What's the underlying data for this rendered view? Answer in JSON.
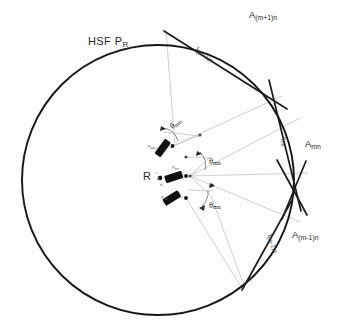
{
  "figure": {
    "title_label": "HSF P",
    "title_sub": "R",
    "center_label": "R"
  },
  "apertures": [
    {
      "name": "aperture-upper",
      "text": "A",
      "sub": "(m+1)n"
    },
    {
      "name": "aperture-middle",
      "text": "A",
      "sub": "mn"
    },
    {
      "name": "aperture-lower",
      "text": "A",
      "sub": "(m-1)n"
    }
  ],
  "arc_labels": [
    {
      "name": "arc-upper",
      "text": "l",
      "sub": "(m+1)n"
    },
    {
      "name": "arc-middle",
      "text": "l",
      "sub": "mn"
    },
    {
      "name": "arc-lower",
      "text": "l",
      "sub": "(m-1)n"
    }
  ],
  "angles": [
    {
      "name": "theta-upper",
      "text": "θ",
      "sub": "mn"
    },
    {
      "name": "theta-middle",
      "text": "θ",
      "sub": "mn"
    },
    {
      "name": "theta-lower",
      "text": "θ",
      "sub": "mn"
    }
  ],
  "elements": [
    {
      "name": "element-upper",
      "tag": "P",
      "sub": "mn"
    },
    {
      "name": "element-middle",
      "tag": "P",
      "sub": "mn"
    },
    {
      "name": "element-lower",
      "tag": "P",
      "sub": "mn"
    }
  ],
  "annotations": {
    "center_note_1": "r",
    "center_note_2": "Δ",
    "center_note_3": "d"
  },
  "colors": {
    "ink": "#1a1a1a",
    "circle": "#171717",
    "ray": "#b9b9b9",
    "tangent": "#202020",
    "element": "#111111",
    "background": "#fdfdfd"
  }
}
